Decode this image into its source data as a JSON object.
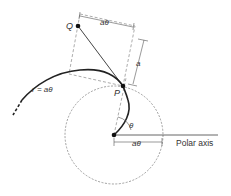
{
  "diagram": {
    "labels": {
      "point_q": "Q",
      "point_p": "P",
      "top_dim": "aθ",
      "side_dim": "a",
      "curve_eq": "r = aθ",
      "angle": "θ",
      "bottom_dim": "aθ",
      "axis": "Polar axis"
    },
    "colors": {
      "stroke": "#222222",
      "dashed": "#888888",
      "text": "#333333",
      "background": "#ffffff"
    }
  }
}
